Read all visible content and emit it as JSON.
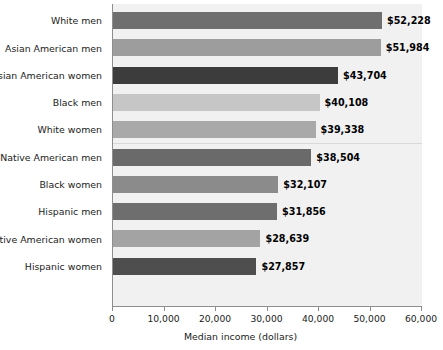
{
  "chart_data": {
    "type": "bar",
    "orientation": "horizontal",
    "title": "",
    "xlabel": "Median income (dollars)",
    "ylabel": "",
    "xlim": [
      0,
      60000
    ],
    "grid": false,
    "legend": null,
    "xticks": [
      0,
      10000,
      20000,
      30000,
      40000,
      50000,
      60000
    ],
    "xtick_labels": [
      "0",
      "10,000",
      "20,000",
      "30,000",
      "40,000",
      "50,000",
      "60,000"
    ],
    "categories": [
      "White men",
      "Asian American men",
      "Asian American women",
      "Black men",
      "White women",
      "Native American men",
      "Black women",
      "Hispanic men",
      "Native American women",
      "Hispanic women"
    ],
    "values": [
      52228,
      51984,
      43704,
      40108,
      39338,
      38504,
      32107,
      31856,
      28639,
      27857
    ],
    "data_labels": [
      "$52,228",
      "$51,984",
      "$43,704",
      "$40,108",
      "$39,338",
      "$38,504",
      "$32,107",
      "$31,856",
      "$28,639",
      "$27,857"
    ],
    "bar_colors": [
      "#6f6f6f",
      "#9d9d9d",
      "#3c3c3c",
      "#c6c6c6",
      "#a9a9a9",
      "#6a6a6a",
      "#8b8b8b",
      "#6e6e6e",
      "#a3a3a3",
      "#4e4e4e"
    ],
    "plot_background": "#f1f1f1",
    "axis_color": "#8e8e8e",
    "separator_after_index": 4
  }
}
